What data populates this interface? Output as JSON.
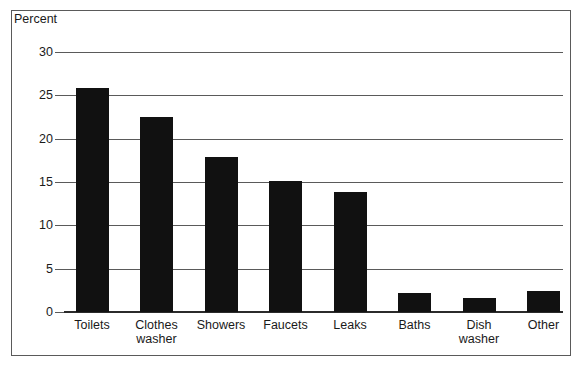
{
  "chart_data": {
    "type": "bar",
    "title": "",
    "subtitle": "",
    "xlabel": "",
    "ylabel": "Percent",
    "ylim": [
      0,
      30
    ],
    "yticks": [
      0,
      5,
      10,
      15,
      20,
      25,
      30
    ],
    "ytick_labels": [
      "0",
      "5",
      "10",
      "15",
      "20",
      "25",
      "30"
    ],
    "grid": true,
    "legend": null,
    "bar_color": "#111111",
    "categories": [
      "Toilets",
      "Clothes washer",
      "Showers",
      "Faucets",
      "Leaks",
      "Baths",
      "Dish washer",
      "Other"
    ],
    "category_lines": [
      [
        "Toilets"
      ],
      [
        "Clothes",
        "washer"
      ],
      [
        "Showers"
      ],
      [
        "Faucets"
      ],
      [
        "Leaks"
      ],
      [
        "Baths"
      ],
      [
        "Dish",
        "washer"
      ],
      [
        "Other"
      ]
    ],
    "values": [
      25.8,
      22.5,
      17.9,
      15.1,
      13.9,
      2.2,
      1.6,
      2.4
    ]
  },
  "frame": {
    "border_color": "#5a5a5a",
    "background": "#ffffff"
  }
}
